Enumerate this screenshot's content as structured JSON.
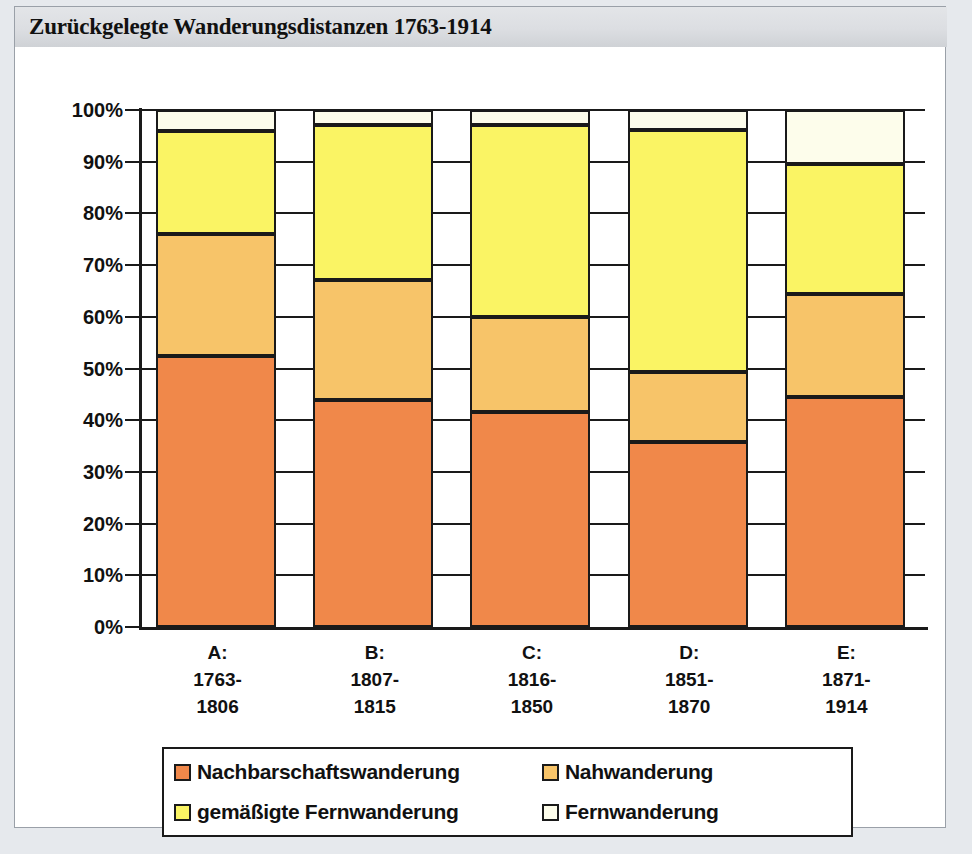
{
  "title": "Zurückgelegte Wanderungsdistanzen 1763-1914",
  "axis": {
    "y_ticks": [
      "0%",
      "10%",
      "20%",
      "30%",
      "40%",
      "50%",
      "60%",
      "70%",
      "80%",
      "90%",
      "100%"
    ]
  },
  "categories": [
    {
      "code": "A:",
      "from": "1763-",
      "to": "1806"
    },
    {
      "code": "B:",
      "from": "1807-",
      "to": "1815"
    },
    {
      "code": "C:",
      "from": "1816-",
      "to": "1850"
    },
    {
      "code": "D:",
      "from": "1851-",
      "to": "1870"
    },
    {
      "code": "E:",
      "from": "1871-",
      "to": "1914"
    }
  ],
  "legend": [
    {
      "label": "Nachbarschaftswanderung",
      "color": "#F0884A"
    },
    {
      "label": "Nahwanderung",
      "color": "#F7C469"
    },
    {
      "label": "gemäßigte Fernwanderung",
      "color": "#FAF464"
    },
    {
      "label": "Fernwanderung",
      "color": "#FDFDEB"
    }
  ],
  "colors": {
    "nachbarschaft": "#F0884A",
    "nah": "#F7C469",
    "gemaessigte_fern": "#FAF464",
    "fern": "#FDFDEB",
    "outline": "#1A1A1A",
    "banner": "#DCDEE2",
    "page_background": "#E6E9ED",
    "paper": "#FFFFFF"
  },
  "chart_data": {
    "type": "bar",
    "stacked": true,
    "stack_mode": "percent",
    "title": "Zurückgelegte Wanderungsdistanzen 1763-1914",
    "xlabel": "",
    "ylabel": "",
    "ylim": [
      0,
      100
    ],
    "yticks": [
      0,
      10,
      20,
      30,
      40,
      50,
      60,
      70,
      80,
      90,
      100
    ],
    "ytick_labels": [
      "0%",
      "10%",
      "20%",
      "30%",
      "40%",
      "50%",
      "60%",
      "70%",
      "80%",
      "90%",
      "100%"
    ],
    "grid": true,
    "legend_position": "bottom",
    "categories": [
      "A: 1763-1806",
      "B: 1807-1815",
      "C: 1816-1850",
      "D: 1851-1870",
      "E: 1871-1914"
    ],
    "series": [
      {
        "name": "Nachbarschaftswanderung",
        "color": "#F0884A",
        "values": [
          52.4,
          44.0,
          41.6,
          35.8,
          44.4
        ]
      },
      {
        "name": "Nahwanderung",
        "color": "#F7C469",
        "values": [
          23.6,
          23.2,
          18.4,
          13.5,
          20.1
        ]
      },
      {
        "name": "gemäßigte Fernwanderung",
        "color": "#FAF464",
        "values": [
          20.0,
          29.9,
          37.1,
          46.8,
          25.0
        ]
      },
      {
        "name": "Fernwanderung",
        "color": "#FDFDEB",
        "values": [
          4.0,
          2.9,
          2.9,
          3.9,
          10.5
        ]
      }
    ],
    "cumulative_tops": {
      "A": [
        52.4,
        76.0,
        96.0,
        100
      ],
      "B": [
        44.0,
        67.2,
        97.1,
        100
      ],
      "C": [
        41.6,
        60.0,
        97.1,
        100
      ],
      "D": [
        35.8,
        49.3,
        96.1,
        100
      ],
      "E": [
        44.4,
        64.5,
        89.5,
        100
      ]
    }
  }
}
